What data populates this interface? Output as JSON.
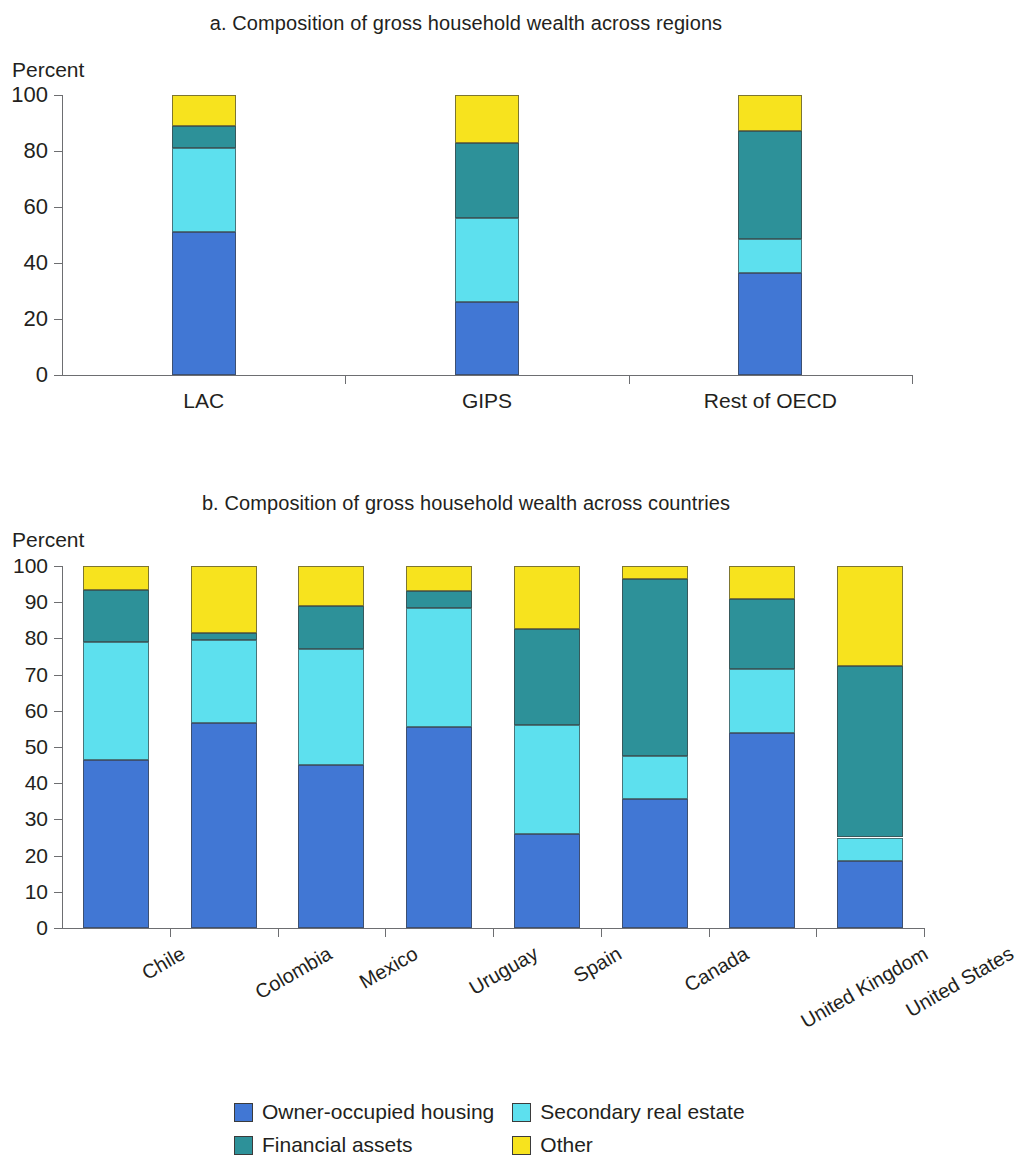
{
  "figure": {
    "axis_unit_label": "Percent"
  },
  "panel_a": {
    "title": "a. Composition of gross household wealth across regions"
  },
  "panel_b": {
    "title": "b. Composition of gross household wealth across countries"
  },
  "legend": {
    "items": [
      {
        "label": "Owner-occupied housing",
        "color": "#4177d4"
      },
      {
        "label": "Secondary real estate",
        "color": "#5de0ee"
      },
      {
        "label": "Financial assets",
        "color": "#2d9199"
      },
      {
        "label": "Other",
        "color": "#f7e31e"
      }
    ]
  },
  "chart_data": [
    {
      "type": "bar",
      "stacked": true,
      "title": "a. Composition of gross household wealth across regions",
      "xlabel": "",
      "ylabel": "Percent",
      "ylim": [
        0,
        100
      ],
      "yticks": [
        0,
        20,
        40,
        60,
        80,
        100
      ],
      "ytick_labels": [
        "0",
        "20",
        "40",
        "60",
        "80",
        "100"
      ],
      "grid": false,
      "legend_position": "bottom",
      "categories": [
        "LAC",
        "GIPS",
        "Rest of OECD"
      ],
      "series": [
        {
          "name": "Owner-occupied housing",
          "color": "#4177d4",
          "values": [
            51,
            26,
            36.5
          ]
        },
        {
          "name": "Secondary real estate",
          "color": "#5de0ee",
          "values": [
            30,
            30,
            12
          ]
        },
        {
          "name": "Financial assets",
          "color": "#2d9199",
          "values": [
            8,
            27,
            38.5
          ]
        },
        {
          "name": "Other",
          "color": "#f7e31e",
          "values": [
            11,
            17,
            13
          ]
        }
      ]
    },
    {
      "type": "bar",
      "stacked": true,
      "title": "b. Composition of gross household wealth across countries",
      "xlabel": "",
      "ylabel": "Percent",
      "ylim": [
        0,
        100
      ],
      "yticks": [
        0,
        10,
        20,
        30,
        40,
        50,
        60,
        70,
        80,
        90,
        100
      ],
      "ytick_labels": [
        "0",
        "10",
        "20",
        "30",
        "40",
        "50",
        "60",
        "70",
        "80",
        "90",
        "100"
      ],
      "grid": false,
      "legend_position": "bottom",
      "categories": [
        "Chile",
        "Colombia",
        "Mexico",
        "Uruguay",
        "Spain",
        "Canada",
        "United Kingdom",
        "United States"
      ],
      "series": [
        {
          "name": "Owner-occupied housing",
          "color": "#4177d4",
          "values": [
            46.5,
            56.5,
            45,
            55.5,
            26,
            35.5,
            54,
            18.5
          ]
        },
        {
          "name": "Secondary real estate",
          "color": "#5de0ee",
          "values": [
            32.5,
            23,
            32,
            33,
            30,
            12,
            17.5,
            6.5
          ]
        },
        {
          "name": "Financial assets",
          "color": "#2d9199",
          "values": [
            14.5,
            2,
            12,
            4.5,
            26.5,
            49,
            19.5,
            47.5
          ]
        },
        {
          "name": "Other",
          "color": "#f7e31e",
          "values": [
            6.5,
            18.5,
            11,
            7,
            17.5,
            3.5,
            9,
            27.5
          ]
        }
      ]
    }
  ]
}
